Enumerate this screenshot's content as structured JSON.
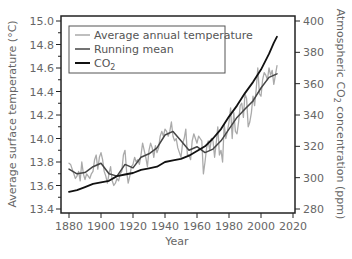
{
  "chart_data": {
    "type": "line",
    "title": "",
    "xlabel": "Year",
    "ylabel_left": "Average surface temperature (°C)",
    "ylabel_right": "Atmospheric CO₂ concentration (ppm)",
    "ylabel_right_parts": {
      "pre": "Atmospheric CO",
      "sub": "2",
      "post": " concentration (ppm)"
    },
    "x_ticks": [
      1880,
      1900,
      1920,
      1940,
      1960,
      1980,
      2000,
      2020
    ],
    "y_left_ticks": [
      "13.4",
      "13.6",
      "13.8",
      "14.0",
      "14.2",
      "14.4",
      "14.6",
      "14.8",
      "15.0"
    ],
    "y_right_ticks": [
      "280",
      "300",
      "320",
      "340",
      "360",
      "380",
      "400"
    ],
    "xlim": [
      1880,
      2020
    ],
    "ylim_left": [
      13.4,
      15.0
    ],
    "ylim_right": [
      280,
      400
    ],
    "grid": false,
    "legend_position": "upper left",
    "legend": [
      {
        "label": "Average annual temperature",
        "color": "#aaaaaa"
      },
      {
        "label": "Running mean",
        "color": "#444444"
      },
      {
        "label": "CO",
        "sub": "2",
        "color": "#111111"
      }
    ],
    "series": [
      {
        "name": "Average annual temperature",
        "axis": "left",
        "color": "#aaaaaa",
        "x": [
          1880,
          1881,
          1882,
          1883,
          1884,
          1885,
          1886,
          1887,
          1888,
          1889,
          1890,
          1891,
          1892,
          1893,
          1894,
          1895,
          1896,
          1897,
          1898,
          1899,
          1900,
          1901,
          1902,
          1903,
          1904,
          1905,
          1906,
          1907,
          1908,
          1909,
          1910,
          1911,
          1912,
          1913,
          1914,
          1915,
          1916,
          1917,
          1918,
          1919,
          1920,
          1921,
          1922,
          1923,
          1924,
          1925,
          1926,
          1927,
          1928,
          1929,
          1930,
          1931,
          1932,
          1933,
          1934,
          1935,
          1936,
          1937,
          1938,
          1939,
          1940,
          1941,
          1942,
          1943,
          1944,
          1945,
          1946,
          1947,
          1948,
          1949,
          1950,
          1951,
          1952,
          1953,
          1954,
          1955,
          1956,
          1957,
          1958,
          1959,
          1960,
          1961,
          1962,
          1963,
          1964,
          1965,
          1966,
          1967,
          1968,
          1969,
          1970,
          1971,
          1972,
          1973,
          1974,
          1975,
          1976,
          1977,
          1978,
          1979,
          1980,
          1981,
          1982,
          1983,
          1984,
          1985,
          1986,
          1987,
          1988,
          1989,
          1990,
          1991,
          1992,
          1993,
          1994,
          1995,
          1996,
          1997,
          1998,
          1999,
          2000,
          2001,
          2002,
          2003,
          2004,
          2005,
          2006,
          2007,
          2008,
          2009,
          2010
        ],
        "values": [
          13.79,
          13.78,
          13.74,
          13.7,
          13.66,
          13.68,
          13.72,
          13.64,
          13.8,
          13.7,
          13.65,
          13.7,
          13.68,
          13.66,
          13.7,
          13.72,
          13.82,
          13.86,
          13.74,
          13.84,
          13.88,
          13.82,
          13.72,
          13.68,
          13.62,
          13.7,
          13.76,
          13.64,
          13.6,
          13.62,
          13.66,
          13.64,
          13.7,
          13.72,
          13.86,
          13.9,
          13.72,
          13.62,
          13.68,
          13.76,
          13.78,
          13.84,
          13.8,
          13.82,
          13.78,
          13.86,
          13.96,
          13.9,
          13.84,
          13.76,
          13.9,
          13.96,
          13.92,
          13.84,
          13.94,
          13.88,
          13.92,
          14.02,
          14.06,
          14.02,
          14.08,
          14.06,
          14.02,
          14.06,
          14.14,
          14.02,
          13.98,
          14.0,
          13.92,
          13.88,
          13.84,
          13.96,
          14.0,
          14.08,
          13.86,
          13.86,
          13.82,
          13.98,
          14.04,
          14.0,
          13.96,
          14.02,
          14.0,
          13.98,
          13.7,
          13.8,
          13.92,
          13.98,
          13.9,
          14.0,
          13.98,
          13.84,
          13.96,
          14.1,
          13.86,
          13.9,
          13.8,
          14.12,
          14.0,
          14.06,
          14.14,
          14.26,
          14.0,
          14.22,
          14.06,
          14.04,
          14.14,
          14.28,
          14.3,
          14.18,
          14.38,
          14.34,
          14.1,
          14.14,
          14.22,
          14.36,
          14.28,
          14.42,
          14.6,
          14.38,
          14.36,
          14.5,
          14.56,
          14.54,
          14.5,
          14.6,
          14.54,
          14.58,
          14.46,
          14.54,
          14.62
        ]
      },
      {
        "name": "Running mean",
        "axis": "left",
        "color": "#444444",
        "x": [
          1880,
          1885,
          1890,
          1895,
          1900,
          1905,
          1910,
          1915,
          1920,
          1925,
          1930,
          1935,
          1940,
          1945,
          1950,
          1955,
          1960,
          1965,
          1970,
          1975,
          1980,
          1985,
          1990,
          1995,
          2000,
          2005,
          2010
        ],
        "values": [
          13.74,
          13.7,
          13.71,
          13.76,
          13.79,
          13.7,
          13.68,
          13.78,
          13.75,
          13.84,
          13.87,
          13.92,
          14.03,
          14.06,
          13.98,
          13.9,
          13.93,
          13.88,
          13.91,
          13.98,
          14.08,
          14.18,
          14.25,
          14.32,
          14.43,
          14.52,
          14.55
        ]
      },
      {
        "name": "CO2",
        "axis": "right",
        "color": "#111111",
        "x": [
          1880,
          1885,
          1890,
          1895,
          1900,
          1905,
          1910,
          1915,
          1920,
          1925,
          1930,
          1935,
          1940,
          1945,
          1950,
          1955,
          1960,
          1965,
          1970,
          1975,
          1980,
          1985,
          1990,
          1995,
          2000,
          2005,
          2008,
          2010
        ],
        "values": [
          291,
          292,
          294,
          296,
          297,
          298,
          301,
          302,
          303,
          305,
          306,
          307,
          310,
          311,
          312,
          314,
          317,
          320,
          325,
          331,
          339,
          346,
          354,
          361,
          369,
          379,
          386,
          390
        ]
      }
    ]
  }
}
